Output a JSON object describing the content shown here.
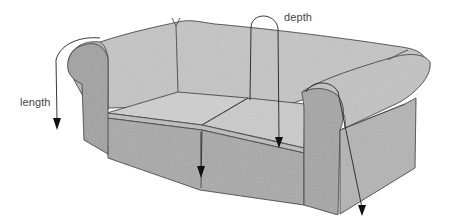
{
  "diagram": {
    "labels": {
      "length": "length",
      "depth": "depth"
    },
    "measurements": [
      {
        "id": "length",
        "label": "length",
        "path": "over left arm down to floor"
      },
      {
        "id": "depth",
        "label": "depth",
        "path": "over back down to seat"
      },
      {
        "id": "seat-front-drop",
        "label": "",
        "path": "from seat front edge down"
      },
      {
        "id": "right-arm-drop",
        "label": "",
        "path": "over right arm down to floor"
      }
    ],
    "colors": {
      "background": "#ffffff",
      "upholstery_light": "#c9c9c9",
      "upholstery_mid": "#b3b3b3",
      "upholstery_dark": "#9f9f9f",
      "seat": "#cfcfcf",
      "outline": "#3a3a3a",
      "arrow": "#222222",
      "label_text": "#444444"
    }
  }
}
